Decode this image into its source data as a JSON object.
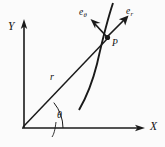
{
  "figure": {
    "kind": "polar-coordinate-diagram",
    "background_color": "#fbfbfb",
    "ink_color": "#1a1a1a",
    "width": 165,
    "height": 147
  },
  "axes": {
    "x_label": "X",
    "y_label": "Y",
    "origin_label": "",
    "origin": {
      "x": 22,
      "y": 128
    },
    "x_tip": {
      "x": 144,
      "y": 128
    },
    "y_tip": {
      "x": 24,
      "y": 21
    }
  },
  "point": {
    "label": "P",
    "x": 108,
    "y": 38
  },
  "radius": {
    "label": "r",
    "label_x": 50,
    "label_y": 78
  },
  "angle": {
    "label": "θ",
    "label_x": 54,
    "label_y": 115,
    "value_degrees": 41
  },
  "unit_vectors": [
    {
      "name": "e-theta",
      "base": "e",
      "subscript": "θ",
      "label_x": 80,
      "label_y": 10,
      "direction": "up-left"
    },
    {
      "name": "e-r",
      "base": "e",
      "subscript": "r",
      "label_x": 124,
      "label_y": 8,
      "direction": "up-right"
    }
  ],
  "curve": {
    "name": "trajectory-path",
    "description": "concave curve passing through point P"
  }
}
